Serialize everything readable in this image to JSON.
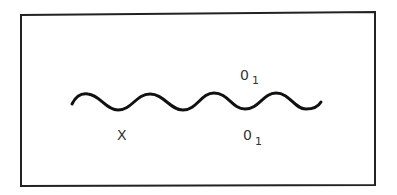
{
  "diagram": {
    "frame": {
      "stroke": "#222222",
      "stroke_width": 2
    },
    "wave": {
      "stroke": "#111111",
      "stroke_width": 3,
      "periods": 4
    },
    "labels": {
      "x_label": "X",
      "upper_label": {
        "base": "0",
        "subscript": "1"
      },
      "lower_label": {
        "base": "0",
        "subscript": "1"
      }
    }
  }
}
